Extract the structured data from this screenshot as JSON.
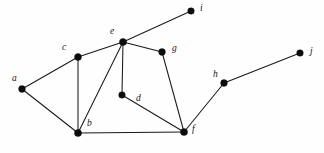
{
  "figure": {
    "kind": "undirected-graph-diagram",
    "width": 324,
    "height": 153,
    "background_color": "#fefefe",
    "stroke_color": "#1a1a1a",
    "vertex_color": "#0d0d0d",
    "label_color": "#141414"
  },
  "graph": {
    "vertices": [
      {
        "id": "a",
        "label": "a",
        "x": 22,
        "y": 89,
        "r": 3.4,
        "label_x": 12,
        "label_y": 74
      },
      {
        "id": "b",
        "label": "b",
        "x": 78,
        "y": 133,
        "r": 3.6,
        "label_x": 87,
        "label_y": 119
      },
      {
        "id": "c",
        "label": "c",
        "x": 78,
        "y": 57,
        "r": 3.5,
        "label_x": 62,
        "label_y": 43
      },
      {
        "id": "d",
        "label": "d",
        "x": 122,
        "y": 95,
        "r": 3.3,
        "label_x": 136,
        "label_y": 94
      },
      {
        "id": "e",
        "label": "e",
        "x": 123,
        "y": 42,
        "r": 3.6,
        "label_x": 110,
        "label_y": 27
      },
      {
        "id": "f",
        "label": "f",
        "x": 184,
        "y": 132,
        "r": 3.6,
        "label_x": 192,
        "label_y": 125
      },
      {
        "id": "g",
        "label": "g",
        "x": 162,
        "y": 52,
        "r": 3.4,
        "label_x": 172,
        "label_y": 44
      },
      {
        "id": "h",
        "label": "h",
        "x": 224,
        "y": 83,
        "r": 3.4,
        "label_x": 213,
        "label_y": 70
      },
      {
        "id": "i",
        "label": "i",
        "x": 191,
        "y": 11,
        "r": 3.3,
        "label_x": 200,
        "label_y": 4
      },
      {
        "id": "j",
        "label": "j",
        "x": 300,
        "y": 53,
        "r": 3.3,
        "label_x": 310,
        "label_y": 47
      }
    ],
    "edges": [
      {
        "from": "a",
        "to": "c"
      },
      {
        "from": "a",
        "to": "b"
      },
      {
        "from": "c",
        "to": "b"
      },
      {
        "from": "c",
        "to": "e"
      },
      {
        "from": "e",
        "to": "i"
      },
      {
        "from": "e",
        "to": "g"
      },
      {
        "from": "e",
        "to": "b"
      },
      {
        "from": "e",
        "to": "d"
      },
      {
        "from": "g",
        "to": "f"
      },
      {
        "from": "d",
        "to": "f"
      },
      {
        "from": "b",
        "to": "f"
      },
      {
        "from": "f",
        "to": "h"
      },
      {
        "from": "h",
        "to": "j"
      }
    ]
  }
}
